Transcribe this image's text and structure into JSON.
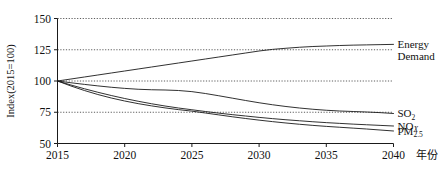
{
  "chart_data": {
    "type": "line",
    "title": "",
    "subtitle": "",
    "xlabel": "年份",
    "ylabel": "Index(2015=100)",
    "xlim": [
      2015,
      2040
    ],
    "ylim": [
      50,
      150
    ],
    "grid": true,
    "grid_values": [
      75,
      100,
      125,
      150
    ],
    "legend_position": "right-inline",
    "x": [
      2015,
      2016,
      2017,
      2018,
      2019,
      2020,
      2021,
      2022,
      2023,
      2024,
      2025,
      2026,
      2027,
      2028,
      2029,
      2030,
      2031,
      2032,
      2033,
      2034,
      2035,
      2036,
      2037,
      2038,
      2039,
      2040
    ],
    "xticks": [
      2015,
      2020,
      2025,
      2030,
      2035,
      2040
    ],
    "xtick_labels": [
      "2015",
      "2020",
      "2025",
      "2030",
      "2035",
      "2040"
    ],
    "yticks": [
      50,
      75,
      100,
      125,
      150
    ],
    "ytick_labels": [
      "50",
      "75",
      "100",
      "125",
      "150"
    ],
    "series": [
      {
        "name": "Energy Demand",
        "label_lines": [
          "Energy",
          "Demand"
        ],
        "values": [
          100.0,
          101.6,
          103.2,
          104.8,
          106.4,
          108.0,
          109.6,
          111.2,
          112.8,
          114.4,
          116.0,
          117.6,
          119.2,
          120.8,
          122.4,
          124.0,
          125.3,
          126.2,
          127.0,
          127.6,
          128.0,
          128.4,
          128.7,
          128.9,
          129.1,
          129.3
        ],
        "end_value": 129.3
      },
      {
        "name": "SO2",
        "label_lines": [
          "SO₂"
        ],
        "values": [
          100.0,
          98.6,
          97.3,
          96.1,
          95.0,
          94.1,
          93.4,
          93.0,
          92.8,
          92.4,
          91.5,
          90.0,
          88.2,
          86.3,
          84.4,
          82.6,
          81.0,
          79.6,
          78.4,
          77.4,
          76.6,
          76.0,
          75.6,
          75.2,
          74.7,
          74.0
        ],
        "end_value": 74.0
      },
      {
        "name": "NOx",
        "label_lines": [
          "NOₓ"
        ],
        "values": [
          100.0,
          96.8,
          93.8,
          91.0,
          88.4,
          86.0,
          83.8,
          81.8,
          80.0,
          78.4,
          77.0,
          75.6,
          74.3,
          73.1,
          72.0,
          70.9,
          69.9,
          69.0,
          68.2,
          67.4,
          66.7,
          66.1,
          65.5,
          65.0,
          64.5,
          64.0
        ],
        "end_value": 64.0
      },
      {
        "name": "PM2.5",
        "label_lines": [
          "PM₂.₅"
        ],
        "values": [
          100.0,
          96.0,
          92.4,
          89.2,
          86.4,
          84.0,
          81.9,
          80.1,
          78.5,
          77.1,
          75.9,
          74.4,
          72.9,
          71.4,
          70.0,
          68.7,
          67.5,
          66.4,
          65.4,
          64.5,
          63.7,
          63.0,
          62.3,
          61.6,
          60.8,
          60.0
        ],
        "end_value": 60.0
      }
    ]
  },
  "axis": {
    "y_title": "Index(2015=100)",
    "x_title": "年份"
  },
  "labels": {
    "energy_line1": "Energy",
    "energy_line2": "Demand",
    "so2_main": "SO",
    "so2_sub": "2",
    "nox_main": "NO",
    "nox_sub": "X",
    "pm_main": "PM",
    "pm_sub": "2.5"
  },
  "colors": {
    "line": "#1a1a1a",
    "grid": "#333333",
    "axis": "#1a1a1a",
    "background": "#ffffff"
  }
}
